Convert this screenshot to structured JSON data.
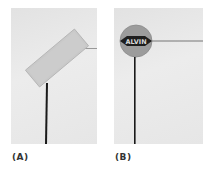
{
  "panels": [
    {
      "id": "A",
      "label": "(A)",
      "description": "Rectangular blank sign plate tilted on a thin dark pole"
    },
    {
      "id": "B",
      "label": "(B)",
      "description": "Round sign with diamond emblem on a thin dark pole",
      "emblem_text": "ALVIN"
    }
  ],
  "colors": {
    "background": "#ffffff",
    "panel_bg": "#e6e6e6",
    "sign_plate": "#c8c8c8",
    "round_sign": "#a0a0a0",
    "emblem": "#1e1e1e",
    "pole": "#1a1a1a"
  }
}
